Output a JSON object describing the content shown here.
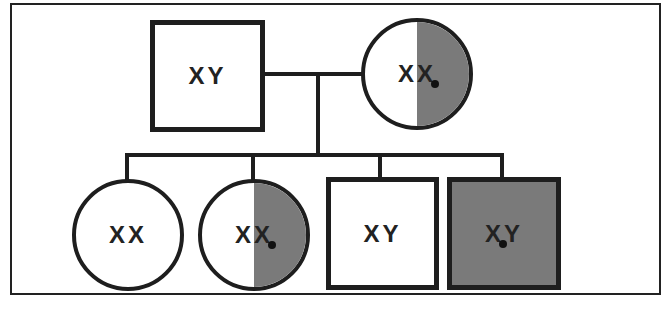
{
  "diagram": {
    "type": "pedigree",
    "colors": {
      "affected_fill": "#7a7a7a",
      "line": "#1e1e1e",
      "background": "#ffffff"
    },
    "generation_1": [
      {
        "id": "father",
        "sex": "male",
        "status": "unaffected",
        "allele1": "X",
        "allele2": "Y",
        "mutant_allele": null
      },
      {
        "id": "mother",
        "sex": "female",
        "status": "carrier",
        "allele1": "X",
        "allele2": "X",
        "mutant_allele": 2
      }
    ],
    "generation_2": [
      {
        "id": "daughter-1",
        "sex": "female",
        "status": "unaffected",
        "allele1": "X",
        "allele2": "X",
        "mutant_allele": null
      },
      {
        "id": "daughter-2",
        "sex": "female",
        "status": "carrier",
        "allele1": "X",
        "allele2": "X",
        "mutant_allele": 2
      },
      {
        "id": "son-1",
        "sex": "male",
        "status": "unaffected",
        "allele1": "X",
        "allele2": "Y",
        "mutant_allele": null
      },
      {
        "id": "son-2",
        "sex": "male",
        "status": "affected",
        "allele1": "X",
        "allele2": "Y",
        "mutant_allele": 1
      }
    ]
  }
}
